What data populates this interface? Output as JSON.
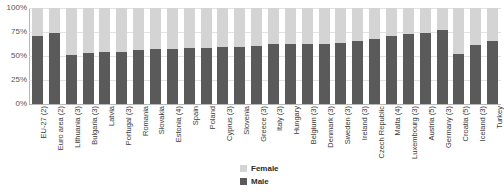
{
  "chart_data": {
    "type": "bar",
    "subtype": "stacked-100-percent",
    "title": "",
    "xlabel": "",
    "ylabel": "",
    "ylim": [
      0,
      100
    ],
    "yticks": [
      "0%",
      "25%",
      "50%",
      "75%",
      "100%"
    ],
    "grid": true,
    "legend_position": "bottom-center",
    "categories": [
      "EU-27 (2)",
      "Euro area (2)",
      "Lithuania (3)",
      "Bulgaria (3)",
      "Latvia",
      "Portugal (3)",
      "Romania",
      "Slovakia",
      "Estonia (4)",
      "Spain",
      "Poland",
      "Cyprus (3)",
      "Slovenia",
      "Greece (3)",
      "Italy (3)",
      "Hungary",
      "Belgium (3)",
      "Denmark (3)",
      "Sweden (3)",
      "Ireland (3)",
      "Czech Republic",
      "Malta (4)",
      "Luxembourg (3)",
      "Austria (5)",
      "Germany (3)",
      "Croatia (5)",
      "Iceland (3)",
      "Turkey"
    ],
    "series": [
      {
        "name": "Male",
        "color": "#5a5a5a",
        "values": [
          71,
          74,
          51,
          53,
          54,
          54,
          56,
          57,
          57,
          58,
          58,
          59,
          59,
          60,
          62,
          62,
          63,
          63,
          64,
          66,
          68,
          71,
          73,
          74,
          77,
          52,
          61,
          66
        ]
      },
      {
        "name": "Female",
        "color": "#d4d4d4",
        "values": [
          29,
          26,
          49,
          47,
          46,
          46,
          44,
          43,
          43,
          42,
          42,
          41,
          41,
          40,
          38,
          38,
          37,
          37,
          36,
          34,
          32,
          29,
          27,
          26,
          23,
          48,
          39,
          34
        ]
      }
    ],
    "legend": [
      {
        "label": "Female",
        "color": "#d4d4d4"
      },
      {
        "label": "Male",
        "color": "#5a5a5a"
      }
    ]
  }
}
